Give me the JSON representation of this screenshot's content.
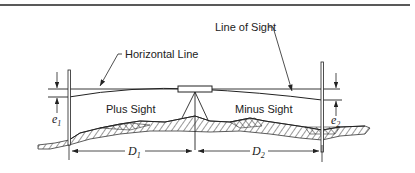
{
  "diagram": {
    "labels": {
      "horizontal_line": "Horizontal Line",
      "line_of_sight": "Line of Sight",
      "plus_sight": "Plus Sight",
      "minus_sight": "Minus Sight",
      "e1": "e",
      "e1_sub": "1",
      "e2": "e",
      "e2_sub": "2",
      "d1": "D",
      "d1_sub": "1",
      "d2": "D",
      "d2_sub": "2"
    },
    "elements": [
      {
        "id": "left-rod",
        "type": "leveling-rod"
      },
      {
        "id": "right-rod",
        "type": "leveling-rod"
      },
      {
        "id": "level-instrument",
        "type": "level-on-tripod"
      },
      {
        "id": "horizontal-line",
        "type": "line"
      },
      {
        "id": "line-of-sight",
        "type": "curve"
      },
      {
        "id": "ground",
        "type": "hatched-terrain"
      }
    ],
    "colors": {
      "ink": "#222222",
      "background": "#ffffff"
    }
  }
}
